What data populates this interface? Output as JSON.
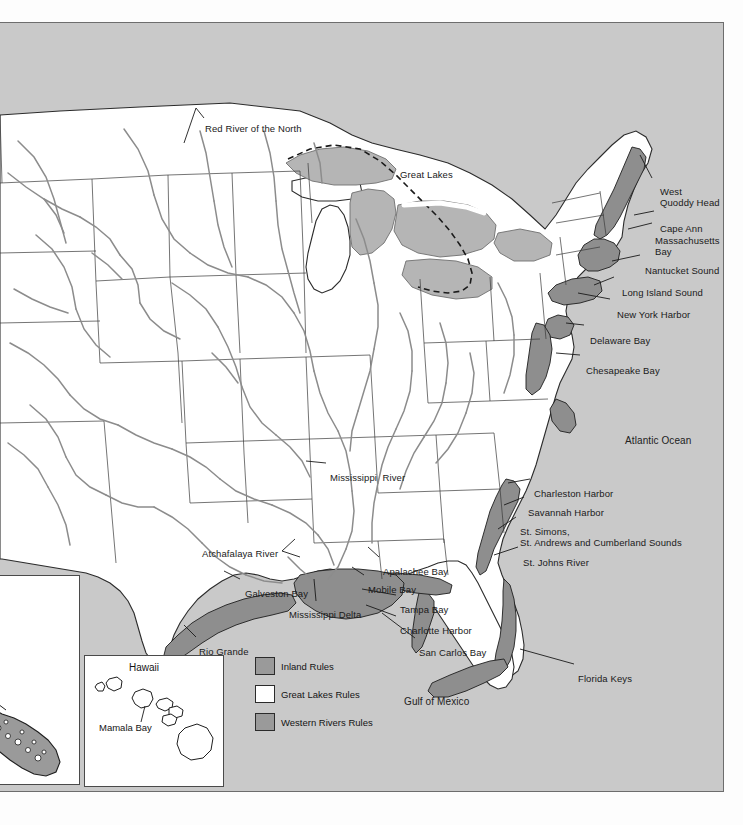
{
  "map": {
    "title": "Navigation Rules Demarcation Lines Map",
    "colors": {
      "ocean": "#c9c9c9",
      "land_inland": "#ffffff",
      "inland_rules_zone": "#9a9a9a",
      "river_line": "#8c8c8c",
      "boundary_line": "#2b2b2b",
      "label_text": "#1a1a1a"
    },
    "ocean_labels": [
      {
        "name": "atlantic-ocean",
        "text": "Atlantic Ocean",
        "x": 625,
        "y": 418
      },
      {
        "name": "gulf-of-mexico",
        "text": "Gulf of Mexico",
        "x": 404,
        "y": 679
      }
    ],
    "region_labels": [
      {
        "name": "great-lakes",
        "text": "Great Lakes",
        "x": 400,
        "y": 152
      }
    ],
    "feature_labels": [
      {
        "name": "red-river-of-the-north",
        "text": "Red River of the North",
        "x": 205,
        "y": 106
      },
      {
        "name": "west-quoddy-head",
        "text": "West\nQuoddy Head",
        "x": 660,
        "y": 169
      },
      {
        "name": "cape-ann",
        "text": "Cape Ann",
        "x": 660,
        "y": 206
      },
      {
        "name": "massachusetts-bay",
        "text": "Massachusetts\nBay",
        "x": 655,
        "y": 218
      },
      {
        "name": "nantucket-sound",
        "text": "Nantucket Sound",
        "x": 645,
        "y": 248
      },
      {
        "name": "long-island-sound",
        "text": "Long Island Sound",
        "x": 622,
        "y": 270
      },
      {
        "name": "new-york-harbor",
        "text": "New York Harbor",
        "x": 617,
        "y": 292
      },
      {
        "name": "delaware-bay",
        "text": "Delaware Bay",
        "x": 590,
        "y": 318
      },
      {
        "name": "chesapeake-bay",
        "text": "Chesapeake Bay",
        "x": 586,
        "y": 348
      },
      {
        "name": "charleston-harbor",
        "text": "Charleston Harbor",
        "x": 534,
        "y": 471
      },
      {
        "name": "savannah-harbor",
        "text": "Savannah Harbor",
        "x": 528,
        "y": 490
      },
      {
        "name": "st-simons-st-andrews-cumberland-sounds",
        "text": "St. Simons,\nSt. Andrews and Cumberland Sounds",
        "x": 520,
        "y": 509
      },
      {
        "name": "st-johns-river",
        "text": "St. Johns River",
        "x": 523,
        "y": 540
      },
      {
        "name": "mississippi-river",
        "text": "Mississippi  River",
        "x": 330,
        "y": 455
      },
      {
        "name": "atchafalaya-river",
        "text": "Atchafalaya River",
        "x": 202,
        "y": 531
      },
      {
        "name": "galveston-bay",
        "text": "Galveston Bay",
        "x": 245,
        "y": 571
      },
      {
        "name": "mississippi-delta",
        "text": "Mississippi Delta",
        "x": 289,
        "y": 592
      },
      {
        "name": "apalachee-bay",
        "text": "Apalachee Bay",
        "x": 383,
        "y": 549
      },
      {
        "name": "mobile-bay",
        "text": "Mobile Bay",
        "x": 368,
        "y": 567
      },
      {
        "name": "tampa-bay",
        "text": "Tampa Bay",
        "x": 400,
        "y": 587
      },
      {
        "name": "charlotte-harbor",
        "text": "Charlotte Harbor",
        "x": 400,
        "y": 608
      },
      {
        "name": "san-carlos-bay",
        "text": "San Carlos Bay",
        "x": 419,
        "y": 630
      },
      {
        "name": "florida-keys",
        "text": "Florida Keys",
        "x": 578,
        "y": 656
      },
      {
        "name": "rio-grande",
        "text": "Rio Grande",
        "x": 199,
        "y": 629
      }
    ]
  },
  "legend": {
    "name": "map-legend",
    "items": [
      {
        "name": "legend-inland-rules",
        "label": "Inland Rules",
        "swatch": "#9a9a9a"
      },
      {
        "name": "legend-great-lakes-rules",
        "label": "Great Lakes Rules",
        "swatch": "#ffffff"
      },
      {
        "name": "legend-western-rivers-rules",
        "label": "Western Rivers Rules",
        "swatch": "#9a9a9a"
      }
    ]
  },
  "insets": {
    "alaska": {
      "name": "alaska-inset",
      "labels": [
        {
          "name": "glacier-bay-partial",
          "text": "cer",
          "x": 2,
          "y": 153
        }
      ]
    },
    "hawaii": {
      "name": "hawaii-inset",
      "title": "Hawaii",
      "labels": [
        {
          "name": "mamala-bay",
          "text": "Mamala Bay",
          "x": 14,
          "y": 60
        }
      ]
    }
  }
}
